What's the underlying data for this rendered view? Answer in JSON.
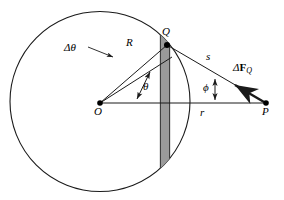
{
  "figure": {
    "colors": {
      "stroke": "#1a1a1a",
      "strip_fill": "#9a9a9a",
      "strip_edge": "#333333",
      "background": "#ffffff"
    },
    "geometry": {
      "circle": {
        "cx": 100,
        "cy": 101.5,
        "r": 90
      },
      "point_O": {
        "x": 100,
        "y": 103
      },
      "point_Q": {
        "x": 167,
        "y": 45
      },
      "point_P": {
        "x": 266,
        "y": 103
      },
      "strip": {
        "x_left": 160,
        "x_right": 170
      }
    },
    "labels": {
      "origin": "O",
      "ring_point": "Q",
      "field_point": "P",
      "radius": "R",
      "distance_s": "s",
      "distance_r": "r",
      "angle_theta": "θ",
      "angle_phi": "ϕ",
      "delta_theta": "Δθ",
      "force_delta": "Δ",
      "force_symbol": "F",
      "force_subscript": "Q"
    },
    "icons": {
      "delta_theta_pointer": "arrow-pointer-icon",
      "theta_span": "double-headed-arrow-icon",
      "phi_span": "double-headed-arrow-icon",
      "force_vector": "vector-arrow-icon"
    }
  }
}
